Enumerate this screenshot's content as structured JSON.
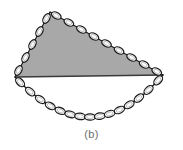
{
  "figure": {
    "caption": "(b)",
    "canvas": {
      "width": 183,
      "height": 150
    },
    "colors": {
      "background": "#ffffff",
      "shaded_region_fill": "#a8a8a8",
      "chain_outline": "#1a1a1a",
      "chain_link_fill_open": "#ffffff",
      "chord_line": "#3a3a3a",
      "caption_text": "#6e6e6e"
    },
    "shaded_region": {
      "label": "enclosed-gray-area",
      "fill": "#a8a8a8",
      "vertices": [
        {
          "name": "left-vertex",
          "x": 15,
          "y": 77
        },
        {
          "name": "apex-vertex",
          "x": 50,
          "y": 12
        },
        {
          "name": "right-vertex",
          "x": 163,
          "y": 75
        }
      ]
    },
    "chord": {
      "label": "horizontal-chord",
      "from": {
        "x": 15,
        "y": 77
      },
      "to": {
        "x": 163,
        "y": 75
      },
      "stroke": "#3a3a3a",
      "stroke_width": 1.6
    },
    "upper_chain": {
      "label": "taut-upper-chain",
      "segments": [
        {
          "name": "left-edge",
          "from": {
            "x": 15,
            "y": 77
          },
          "to": {
            "x": 50,
            "y": 12
          },
          "link_count": 5
        },
        {
          "name": "right-edge",
          "from": {
            "x": 50,
            "y": 12
          },
          "to": {
            "x": 163,
            "y": 75
          },
          "link_count": 9
        }
      ],
      "link_rx": 5.2,
      "link_ry": 3.1
    },
    "lower_chain": {
      "label": "slack-catenary-chain",
      "from": {
        "x": 15,
        "y": 77
      },
      "to": {
        "x": 163,
        "y": 75
      },
      "lowest_point": {
        "x": 90,
        "y": 117
      },
      "link_count": 15,
      "link_rx": 5.4,
      "link_ry": 3.2,
      "sag_depth": 41
    }
  }
}
